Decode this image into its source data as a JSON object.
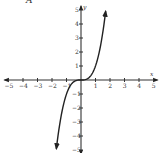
{
  "choice_label": "A",
  "chart_data": {
    "type": "line",
    "title": "",
    "xlabel": "x",
    "ylabel": "y",
    "xlim": [
      -5,
      5
    ],
    "ylim": [
      -5,
      5
    ],
    "grid": false,
    "x_ticks": [
      -5,
      -4,
      -3,
      -2,
      -1,
      1,
      2,
      3,
      4,
      5
    ],
    "y_ticks": [
      -5,
      -4,
      -3,
      -2,
      -1,
      1,
      2,
      3,
      4,
      5
    ],
    "series": [
      {
        "name": "y = x^3",
        "x": [
          -1.7,
          -1.5,
          -1.25,
          -1,
          -0.75,
          -0.5,
          -0.25,
          0,
          0.25,
          0.5,
          0.75,
          1,
          1.25,
          1.5,
          1.7
        ],
        "y": [
          -4.91,
          -3.38,
          -1.95,
          -1,
          -0.42,
          -0.13,
          -0.02,
          0,
          0.02,
          0.13,
          0.42,
          1,
          1.95,
          3.38,
          4.91
        ],
        "arrows": "both"
      }
    ],
    "curve_color": "#222222"
  },
  "axes": {
    "x_name": "x",
    "y_name": "y"
  }
}
